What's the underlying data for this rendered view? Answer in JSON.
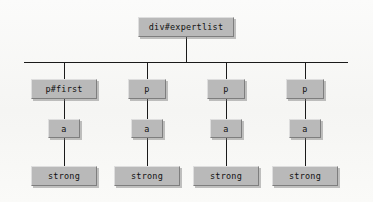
{
  "diagram": {
    "type": "dom-tree",
    "background_color": "#f7f7f5",
    "node_fill_color": "#b9b9b9",
    "line_color": "#1a1a1a",
    "root": {
      "label": "div#expertlist",
      "x": 138,
      "y": 17,
      "w": 96,
      "h": 20
    },
    "trunk": {
      "x": 186,
      "top": 37,
      "bottom": 62
    },
    "bus": {
      "x1": 24,
      "x2": 348,
      "y": 62
    },
    "columns": [
      {
        "center": 64,
        "nodes": [
          {
            "label": "p#first",
            "level": "element",
            "x": 31,
            "y": 79,
            "w": 66,
            "h": 20
          },
          {
            "label": "a",
            "level": "element",
            "x": 48,
            "y": 119,
            "w": 32,
            "h": 19
          },
          {
            "label": "strong",
            "level": "element",
            "x": 31,
            "y": 166,
            "w": 66,
            "h": 20
          }
        ]
      },
      {
        "center": 147,
        "nodes": [
          {
            "label": "p",
            "level": "element",
            "x": 128,
            "y": 79,
            "w": 38,
            "h": 20
          },
          {
            "label": "a",
            "level": "element",
            "x": 131,
            "y": 119,
            "w": 32,
            "h": 19
          },
          {
            "label": "strong",
            "level": "element",
            "x": 114,
            "y": 166,
            "w": 66,
            "h": 20
          }
        ]
      },
      {
        "center": 226,
        "nodes": [
          {
            "label": "p",
            "level": "element",
            "x": 207,
            "y": 79,
            "w": 38,
            "h": 20
          },
          {
            "label": "a",
            "level": "element",
            "x": 210,
            "y": 119,
            "w": 32,
            "h": 19
          },
          {
            "label": "strong",
            "level": "element",
            "x": 193,
            "y": 166,
            "w": 66,
            "h": 20
          }
        ]
      },
      {
        "center": 305,
        "nodes": [
          {
            "label": "p",
            "level": "element",
            "x": 286,
            "y": 79,
            "w": 38,
            "h": 20
          },
          {
            "label": "a",
            "level": "element",
            "x": 289,
            "y": 119,
            "w": 32,
            "h": 19
          },
          {
            "label": "strong",
            "level": "element",
            "x": 272,
            "y": 166,
            "w": 66,
            "h": 20
          }
        ]
      }
    ],
    "labels": {
      "root": "div#expertlist",
      "p_first": "p#first",
      "p": "p",
      "a": "a",
      "strong": "strong"
    }
  }
}
